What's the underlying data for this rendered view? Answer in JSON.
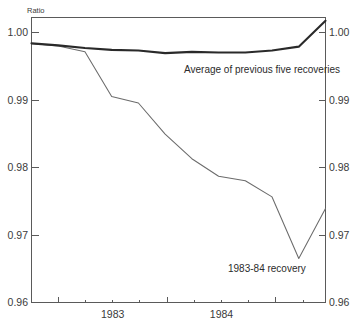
{
  "chart_data": {
    "type": "line",
    "title": "",
    "subtitle": "",
    "unit_label": "Ratio",
    "xlabel": "",
    "ylabel": "Ratio",
    "ylim": [
      0.96,
      1.004
    ],
    "xlim": [
      0,
      11
    ],
    "grid": false,
    "legend_position": "inline-annotation",
    "y_ticks": [
      1.0,
      0.99,
      0.98,
      0.97,
      0.96
    ],
    "y_tick_labels": [
      "1.00",
      "0.99",
      "0.98",
      "0.97",
      "0.96"
    ],
    "y_tick_labels_right": [
      "1.00",
      "0.99",
      "0.98",
      "0.97",
      "0.96"
    ],
    "x_tick_labels": [
      "1983",
      "1984"
    ],
    "x_tick_label_positions": [
      3,
      7
    ],
    "x_major_ticks": [
      1,
      5,
      9
    ],
    "x_minor_ticks": [
      0,
      2,
      3,
      4,
      6,
      7,
      8,
      10,
      11
    ],
    "series": [
      {
        "name": "Average of previous five recoveries",
        "style": "thick",
        "color": "#2a2a2a",
        "x": [
          0,
          1,
          2,
          3,
          4,
          5,
          6,
          7,
          8,
          9,
          10,
          11
        ],
        "values": [
          1.0,
          0.9997,
          0.9993,
          0.999,
          0.9989,
          0.9985,
          0.9987,
          0.9986,
          0.9986,
          0.9989,
          0.9995,
          1.0035
        ]
      },
      {
        "name": "1983-84 recovery",
        "style": "thin",
        "color": "#6b6b6b",
        "x": [
          0,
          1,
          2,
          3,
          4,
          5,
          6,
          7,
          8,
          9,
          10,
          11
        ],
        "values": [
          1.0,
          0.9996,
          0.9987,
          0.9918,
          0.9908,
          0.986,
          0.9822,
          0.9795,
          0.9788,
          0.9763,
          0.9668,
          0.9745
        ]
      }
    ],
    "annotations": [
      {
        "name": "average-series-label",
        "text": "Average of previous five recoveries",
        "x_px": 184,
        "y_px": 73
      },
      {
        "name": "recovery-series-label",
        "text": "1983-84 recovery",
        "x_px": 228,
        "y_px": 272
      }
    ]
  }
}
